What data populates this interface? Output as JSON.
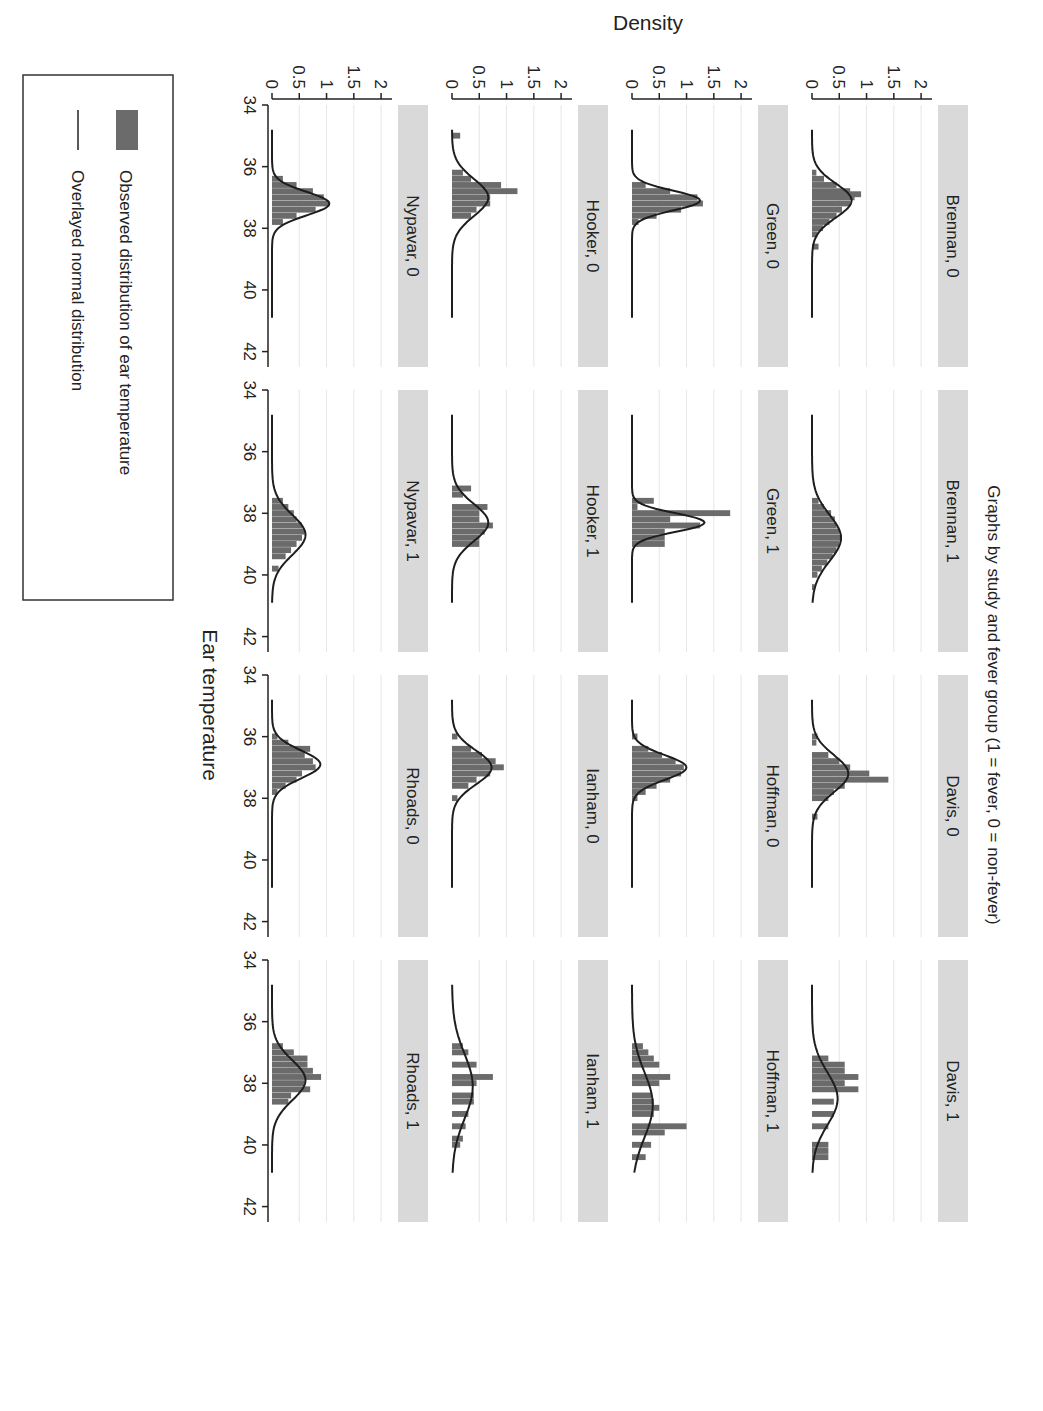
{
  "chart_data": {
    "type": "bar",
    "subtype": "histogram_with_normal_overlay_small_multiples",
    "title": "Graphs by study and fever group (1 = fever, 0 = non-fever)",
    "xlabel": "Ear temperature",
    "ylabel": "Density",
    "xlim": [
      34,
      42.5
    ],
    "ylim": [
      0,
      2.2
    ],
    "xticks": [
      34,
      36,
      38,
      40,
      42
    ],
    "yticks": [
      0,
      0.5,
      1,
      1.5,
      2
    ],
    "ytick_labels": [
      "0",
      "0.5",
      "1",
      "1.5",
      "2"
    ],
    "grid": "horizontal light gray",
    "layout": {
      "rows": 4,
      "cols": 4,
      "page_rotation_deg": 90
    },
    "legend": {
      "position": "bottom-left",
      "entries": [
        {
          "label": "Observed distribution of ear temperature",
          "symbol": "bar",
          "color": "#6b6b6b"
        },
        {
          "label": "Overlayed normal distribution",
          "symbol": "line",
          "color": "#222222"
        }
      ]
    },
    "colors": {
      "bar": "#6b6b6b",
      "line": "#1e1e1e",
      "strip": "#d9d9d9",
      "grid": "#e6e6e6"
    },
    "panels": [
      {
        "label": "Brennan, 0",
        "row": 0,
        "col": 0,
        "mean": 37.1,
        "sd": 0.55,
        "bins": [
          [
            36.2,
            0.08
          ],
          [
            36.4,
            0.22
          ],
          [
            36.6,
            0.45
          ],
          [
            36.8,
            0.7
          ],
          [
            36.9,
            0.9
          ],
          [
            37.0,
            0.78
          ],
          [
            37.2,
            0.7
          ],
          [
            37.4,
            0.55
          ],
          [
            37.6,
            0.45
          ],
          [
            37.8,
            0.32
          ],
          [
            38.0,
            0.2
          ],
          [
            38.2,
            0.1
          ],
          [
            38.6,
            0.12
          ]
        ]
      },
      {
        "label": "Brennan, 1",
        "row": 0,
        "col": 1,
        "mean": 38.8,
        "sd": 0.75,
        "bins": [
          [
            37.6,
            0.12
          ],
          [
            37.8,
            0.22
          ],
          [
            38.0,
            0.35
          ],
          [
            38.2,
            0.42
          ],
          [
            38.4,
            0.45
          ],
          [
            38.6,
            0.5
          ],
          [
            38.8,
            0.55
          ],
          [
            39.0,
            0.5
          ],
          [
            39.2,
            0.45
          ],
          [
            39.4,
            0.38
          ],
          [
            39.6,
            0.28
          ],
          [
            39.8,
            0.18
          ],
          [
            40.0,
            0.1
          ],
          [
            40.4,
            0.05
          ]
        ]
      },
      {
        "label": "Davis, 0",
        "row": 0,
        "col": 2,
        "mean": 37.2,
        "sd": 0.6,
        "bins": [
          [
            36.0,
            0.1
          ],
          [
            36.2,
            0.08
          ],
          [
            36.6,
            0.3
          ],
          [
            36.8,
            0.5
          ],
          [
            37.0,
            0.7
          ],
          [
            37.2,
            1.05
          ],
          [
            37.4,
            1.4
          ],
          [
            37.6,
            0.6
          ],
          [
            37.8,
            0.4
          ],
          [
            38.0,
            0.3
          ],
          [
            38.6,
            0.1
          ]
        ]
      },
      {
        "label": "Davis, 1",
        "row": 0,
        "col": 3,
        "mean": 38.5,
        "sd": 0.85,
        "bins": [
          [
            37.2,
            0.3
          ],
          [
            37.4,
            0.6
          ],
          [
            37.6,
            0.6
          ],
          [
            37.8,
            0.85
          ],
          [
            38.0,
            0.6
          ],
          [
            38.2,
            0.85
          ],
          [
            38.6,
            0.4
          ],
          [
            39.0,
            0.4
          ],
          [
            39.4,
            0.3
          ],
          [
            40.0,
            0.3
          ],
          [
            40.2,
            0.3
          ],
          [
            40.4,
            0.3
          ]
        ]
      },
      {
        "label": "Green, 0",
        "row": 1,
        "col": 0,
        "mean": 37.1,
        "sd": 0.32,
        "bins": [
          [
            36.6,
            0.25
          ],
          [
            36.8,
            0.7
          ],
          [
            37.0,
            1.2
          ],
          [
            37.2,
            1.3
          ],
          [
            37.4,
            0.9
          ],
          [
            37.6,
            0.45
          ],
          [
            37.8,
            0.12
          ]
        ]
      },
      {
        "label": "Green, 1",
        "row": 1,
        "col": 1,
        "mean": 38.3,
        "sd": 0.3,
        "bins": [
          [
            37.6,
            0.4
          ],
          [
            37.8,
            0.1
          ],
          [
            38.0,
            1.8
          ],
          [
            38.2,
            0.7
          ],
          [
            38.4,
            1.25
          ],
          [
            38.6,
            0.6
          ],
          [
            38.8,
            0.6
          ],
          [
            39.0,
            0.6
          ]
        ]
      },
      {
        "label": "Hoffman, 0",
        "row": 1,
        "col": 2,
        "mean": 37.0,
        "sd": 0.4,
        "bins": [
          [
            36.0,
            0.1
          ],
          [
            36.4,
            0.3
          ],
          [
            36.6,
            0.55
          ],
          [
            36.8,
            0.8
          ],
          [
            37.0,
            0.95
          ],
          [
            37.2,
            0.9
          ],
          [
            37.4,
            0.7
          ],
          [
            37.6,
            0.45
          ],
          [
            37.8,
            0.25
          ],
          [
            38.0,
            0.1
          ]
        ]
      },
      {
        "label": "Hoffman, 1",
        "row": 1,
        "col": 3,
        "mean": 38.7,
        "sd": 1.05,
        "bins": [
          [
            36.8,
            0.2
          ],
          [
            37.0,
            0.3
          ],
          [
            37.2,
            0.4
          ],
          [
            37.4,
            0.5
          ],
          [
            37.8,
            0.7
          ],
          [
            38.0,
            0.5
          ],
          [
            38.4,
            0.35
          ],
          [
            38.6,
            0.4
          ],
          [
            38.8,
            0.5
          ],
          [
            39.0,
            0.4
          ],
          [
            39.4,
            1.0
          ],
          [
            39.6,
            0.6
          ],
          [
            40.0,
            0.35
          ],
          [
            40.4,
            0.25
          ]
        ]
      },
      {
        "label": "Hooker, 0",
        "row": 2,
        "col": 0,
        "mean": 37.0,
        "sd": 0.6,
        "bins": [
          [
            35.0,
            0.15
          ],
          [
            36.2,
            0.2
          ],
          [
            36.4,
            0.35
          ],
          [
            36.6,
            0.9
          ],
          [
            36.8,
            1.2
          ],
          [
            37.0,
            0.7
          ],
          [
            37.2,
            0.7
          ],
          [
            37.4,
            0.45
          ],
          [
            37.6,
            0.35
          ]
        ]
      },
      {
        "label": "Hooker, 1",
        "row": 2,
        "col": 1,
        "mean": 38.3,
        "sd": 0.6,
        "bins": [
          [
            37.2,
            0.35
          ],
          [
            37.4,
            0.2
          ],
          [
            37.8,
            0.65
          ],
          [
            38.0,
            0.5
          ],
          [
            38.2,
            0.5
          ],
          [
            38.4,
            0.75
          ],
          [
            38.6,
            0.6
          ],
          [
            38.8,
            0.5
          ],
          [
            39.0,
            0.5
          ]
        ]
      },
      {
        "label": "Ianham, 0",
        "row": 2,
        "col": 2,
        "mean": 37.0,
        "sd": 0.55,
        "bins": [
          [
            36.0,
            0.1
          ],
          [
            36.4,
            0.35
          ],
          [
            36.6,
            0.55
          ],
          [
            36.8,
            0.8
          ],
          [
            37.0,
            0.95
          ],
          [
            37.2,
            0.7
          ],
          [
            37.4,
            0.45
          ],
          [
            37.6,
            0.3
          ],
          [
            38.0,
            0.1
          ]
        ]
      },
      {
        "label": "Ianham, 1",
        "row": 2,
        "col": 3,
        "mean": 38.1,
        "sd": 1.05,
        "bins": [
          [
            36.8,
            0.2
          ],
          [
            37.0,
            0.3
          ],
          [
            37.4,
            0.45
          ],
          [
            37.8,
            0.75
          ],
          [
            38.0,
            0.45
          ],
          [
            38.4,
            0.4
          ],
          [
            38.6,
            0.4
          ],
          [
            39.0,
            0.3
          ],
          [
            39.4,
            0.25
          ],
          [
            39.8,
            0.2
          ],
          [
            40.0,
            0.15
          ]
        ]
      },
      {
        "label": "Nypavar, 0",
        "row": 3,
        "col": 0,
        "mean": 37.2,
        "sd": 0.38,
        "bins": [
          [
            36.4,
            0.2
          ],
          [
            36.6,
            0.45
          ],
          [
            36.8,
            0.75
          ],
          [
            37.0,
            0.95
          ],
          [
            37.2,
            1.05
          ],
          [
            37.4,
            0.8
          ],
          [
            37.6,
            0.45
          ],
          [
            37.8,
            0.2
          ]
        ]
      },
      {
        "label": "Nypavar, 1",
        "row": 3,
        "col": 1,
        "mean": 38.7,
        "sd": 0.65,
        "bins": [
          [
            37.6,
            0.2
          ],
          [
            37.8,
            0.3
          ],
          [
            38.0,
            0.4
          ],
          [
            38.2,
            0.45
          ],
          [
            38.4,
            0.55
          ],
          [
            38.6,
            0.6
          ],
          [
            38.8,
            0.55
          ],
          [
            39.0,
            0.45
          ],
          [
            39.2,
            0.35
          ],
          [
            39.4,
            0.25
          ],
          [
            39.8,
            0.12
          ]
        ]
      },
      {
        "label": "Rhoads, 0",
        "row": 3,
        "col": 2,
        "mean": 36.9,
        "sd": 0.45,
        "bins": [
          [
            36.0,
            0.1
          ],
          [
            36.2,
            0.3
          ],
          [
            36.4,
            0.7
          ],
          [
            36.6,
            0.6
          ],
          [
            36.8,
            0.75
          ],
          [
            37.0,
            0.8
          ],
          [
            37.2,
            0.55
          ],
          [
            37.4,
            0.45
          ],
          [
            37.6,
            0.25
          ],
          [
            37.8,
            0.1
          ]
        ]
      },
      {
        "label": "Rhoads, 1",
        "row": 3,
        "col": 3,
        "mean": 37.9,
        "sd": 0.65,
        "bins": [
          [
            36.8,
            0.2
          ],
          [
            37.0,
            0.4
          ],
          [
            37.2,
            0.65
          ],
          [
            37.4,
            0.65
          ],
          [
            37.6,
            0.75
          ],
          [
            37.8,
            0.9
          ],
          [
            38.0,
            0.6
          ],
          [
            38.2,
            0.7
          ],
          [
            38.4,
            0.35
          ],
          [
            38.6,
            0.3
          ]
        ]
      }
    ]
  }
}
